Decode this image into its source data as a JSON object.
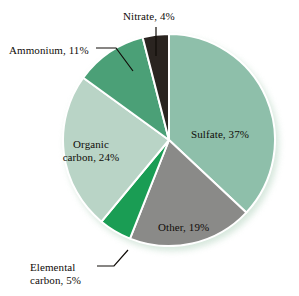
{
  "figure": {
    "background_color": "#ffffff",
    "shadow_color": "#cfe3d6"
  },
  "chart_data": {
    "type": "pie",
    "title": "",
    "subtitle": "",
    "xlabel": "",
    "ylabel": "",
    "grid": false,
    "legend_position": "none",
    "labels_placement": "inside-and-callout",
    "total": 100,
    "units": "%",
    "start_angle_deg": 0,
    "direction": "clockwise",
    "categories": [
      "Sulfate",
      "Other",
      "Elemental carbon",
      "Organic carbon",
      "Ammonium",
      "Nitrate"
    ],
    "values": [
      37,
      19,
      5,
      24,
      11,
      4
    ],
    "colors": [
      "#8ebfaa",
      "#8a8a88",
      "#1a9d54",
      "#b9d4c6",
      "#4ba077",
      "#2a2420"
    ],
    "slices": [
      {
        "name": "Sulfate",
        "value": 37,
        "color": "#8ebfaa",
        "label": "Sulfate, 37%",
        "label_style": "inside",
        "start_deg": 0,
        "end_deg": 133.2
      },
      {
        "name": "Other",
        "value": 19,
        "color": "#8a8a88",
        "label": "Other, 19%",
        "label_style": "inside",
        "start_deg": 133.2,
        "end_deg": 201.6
      },
      {
        "name": "Elemental carbon",
        "value": 5,
        "color": "#1a9d54",
        "label_line1": "Elemental",
        "label_line2": "carbon, 5%",
        "label": "Elemental carbon, 5%",
        "label_style": "callout",
        "start_deg": 201.6,
        "end_deg": 219.6
      },
      {
        "name": "Organic carbon",
        "value": 24,
        "color": "#b9d4c6",
        "label_line1": "Organic",
        "label_line2": "carbon, 24%",
        "label": "Organic carbon, 24%",
        "label_style": "inside",
        "start_deg": 219.6,
        "end_deg": 306.0
      },
      {
        "name": "Ammonium",
        "value": 11,
        "color": "#4ba077",
        "label": "Ammonium, 11%",
        "label_style": "callout",
        "start_deg": 306.0,
        "end_deg": 345.6
      },
      {
        "name": "Nitrate",
        "value": 4,
        "color": "#2a2420",
        "label": "Nitrate, 4%",
        "label_style": "callout",
        "start_deg": 345.6,
        "end_deg": 360.0
      }
    ]
  }
}
